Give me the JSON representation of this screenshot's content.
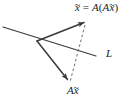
{
  "figure": {
    "name": "linear-transformation-reflection-diagram",
    "background_color": "#ffffff",
    "stroke_color": "#3a3a3a",
    "text_color": "#1b1b1b",
    "width": 131,
    "height": 103,
    "labels": {
      "result_vector": {
        "text": "x = A(Ax)",
        "parts": {
          "lhs_symbol": "x",
          "lhs_accent": "~",
          "equals": "=",
          "operator": "A",
          "open_paren": "(",
          "inner_operator": "A",
          "inner_symbol": "x",
          "inner_accent": "~",
          "close_paren": ")"
        }
      },
      "image_vector": {
        "text": "Ax",
        "parts": {
          "operator": "A",
          "symbol": "x",
          "accent": "~"
        }
      },
      "line": {
        "text": "L"
      }
    },
    "geometry": {
      "vertex": {
        "x": 37,
        "y": 41
      },
      "line_L": {
        "x1": 3,
        "y1": 27,
        "x2": 96,
        "y2": 56
      },
      "vector_xbar": {
        "x1": 37,
        "y1": 41,
        "x2": 85,
        "y2": 22
      },
      "vector_axbar": {
        "x1": 37,
        "y1": 41,
        "x2": 69,
        "y2": 81
      },
      "dashed_connector": {
        "x1": 85,
        "y1": 24,
        "x2": 70,
        "y2": 82
      }
    }
  }
}
